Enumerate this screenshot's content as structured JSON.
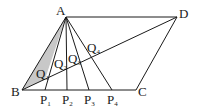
{
  "diagram": {
    "title": "",
    "stroke_color": "#1a1a1a",
    "shade_color": "#c8c8c8",
    "points": {
      "A": {
        "x": 66,
        "y": 17
      },
      "D": {
        "x": 177,
        "y": 17
      },
      "B": {
        "x": 22,
        "y": 90
      },
      "C": {
        "x": 136,
        "y": 90
      },
      "P1": {
        "x": 45,
        "y": 90
      },
      "P2": {
        "x": 67,
        "y": 90
      },
      "P3": {
        "x": 89,
        "y": 90
      },
      "P4": {
        "x": 112,
        "y": 90
      }
    },
    "labels": {
      "A": "A",
      "B": "B",
      "C": "C",
      "D": "D",
      "P1": {
        "base": "P",
        "sub": "1"
      },
      "P2": {
        "base": "P",
        "sub": "2"
      },
      "P3": {
        "base": "P",
        "sub": "3"
      },
      "P4": {
        "base": "P",
        "sub": "4"
      },
      "Q1": {
        "base": "Q",
        "sub": "1"
      },
      "Q2": {
        "base": "Q",
        "sub": "2"
      },
      "Q3": {
        "base": "Q",
        "sub": "3"
      },
      "Q4": {
        "base": "Q",
        "sub": "4"
      }
    },
    "segments": [
      "AB",
      "AD",
      "BC",
      "CD",
      "BD",
      "AP1",
      "AP2",
      "AP3",
      "AP4"
    ],
    "shaded_region": "triangle A-B-Q1"
  }
}
